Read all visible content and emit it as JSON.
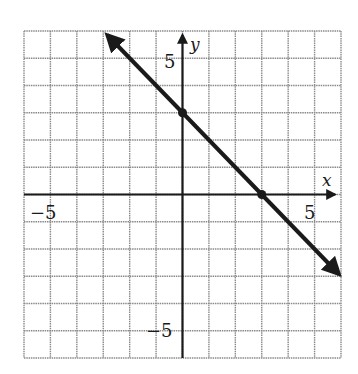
{
  "chart_data": {
    "type": "line",
    "title": "",
    "xlabel": "x",
    "ylabel": "y",
    "xlim": [
      -6,
      6
    ],
    "ylim": [
      -6,
      6
    ],
    "grid": true,
    "grid_step": 1,
    "tick_labels": {
      "x": [
        {
          "value": -5,
          "label": "−5"
        },
        {
          "value": 5,
          "label": "5"
        }
      ],
      "y": [
        {
          "value": 5,
          "label": "5"
        },
        {
          "value": -5,
          "label": "−5"
        }
      ]
    },
    "series": [
      {
        "name": "line",
        "equation": "y = -x + 3",
        "slope": -1,
        "intercept": 3,
        "x": [
          -3,
          6
        ],
        "y": [
          6,
          -3
        ],
        "marked_points": [
          {
            "x": 0,
            "y": 3
          },
          {
            "x": 3,
            "y": 0
          }
        ],
        "arrows_both_ends": true
      }
    ],
    "legend": null
  },
  "labels": {
    "x_axis": "x",
    "y_axis": "y",
    "x_neg5": "−5",
    "x_pos5": "5",
    "y_pos5": "5",
    "y_neg5": "−5"
  }
}
